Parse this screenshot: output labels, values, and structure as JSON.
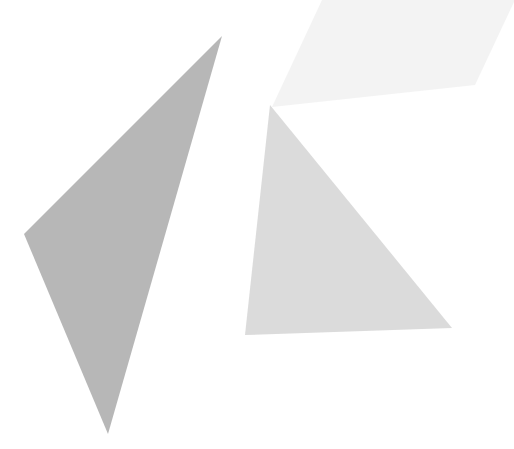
{
  "canvas": {
    "width": 514,
    "height": 449,
    "background_color": "#ffffff",
    "title": "Overlapping Translucent Triangles"
  },
  "palette": {
    "background": "#ffffff",
    "dark_triangle": "#8a8a8a",
    "medium_triangle": "#c5c5c5",
    "light_triangle": "#ececec",
    "darkest_overlap": "#6a6a6a",
    "dark_medium_overlap": "#7e7e7e",
    "medium_light_overlap": "#bcbcbc"
  },
  "chart_data": {
    "type": "scatter",
    "xlabel": "",
    "ylabel": "",
    "xlim": [
      0,
      514
    ],
    "ylim": [
      0,
      449
    ],
    "grid": false,
    "legend": "none",
    "shapes": [
      {
        "name": "dark-gray-triangle",
        "fill": "#8a8a8a",
        "opacity": 0.62,
        "z_order": 1,
        "points": [
          [
            222,
            36
          ],
          [
            24,
            234
          ],
          [
            108,
            434
          ]
        ]
      },
      {
        "name": "medium-gray-triangle",
        "fill": "#c5c5c5",
        "opacity": 0.62,
        "z_order": 2,
        "points": [
          [
            270,
            105
          ],
          [
            245,
            335
          ],
          [
            452,
            328
          ]
        ]
      },
      {
        "name": "light-gray-triangle",
        "fill": "#ececec",
        "opacity": 0.62,
        "z_order": 3,
        "points": [
          [
            272,
            107
          ],
          [
            322,
            0
          ],
          [
            514,
            0
          ],
          [
            475,
            85
          ]
        ]
      }
    ]
  },
  "shapes": {
    "dark": {
      "label": "dark gray triangle",
      "points_attr": "222,36 24,234 108,434"
    },
    "medium": {
      "label": "medium gray triangle",
      "points_attr": "270,105 245,335 452,328"
    },
    "light": {
      "label": "light gray triangle",
      "points_attr": "272,107 322,0 514,0 514,2 475,85"
    }
  }
}
